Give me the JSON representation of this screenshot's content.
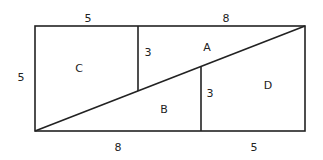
{
  "diagram": {
    "stroke_color": "#222222",
    "background": "#ffffff",
    "dimensions": {
      "top_left": "5",
      "top_right": "8",
      "left_side": "5",
      "bottom_left": "8",
      "bottom_right": "5",
      "inner_left_segment": "3",
      "inner_right_segment": "3"
    },
    "regions": {
      "a": "A",
      "b": "B",
      "c": "C",
      "d": "D"
    }
  }
}
